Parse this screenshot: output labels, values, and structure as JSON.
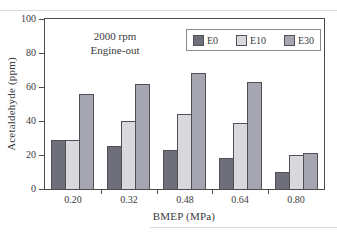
{
  "chart_data": {
    "type": "bar",
    "categories": [
      "0.20",
      "0.32",
      "0.48",
      "0.64",
      "0.80"
    ],
    "series": [
      {
        "name": "E0",
        "color": "#6f6f79",
        "values": [
          29,
          25,
          23,
          18,
          10
        ]
      },
      {
        "name": "E10",
        "color": "#d9d9dd",
        "values": [
          29,
          40,
          44,
          39,
          20
        ]
      },
      {
        "name": "E30",
        "color": "#a6a6b0",
        "values": [
          56,
          62,
          68,
          63,
          21
        ]
      }
    ],
    "xlabel": "BMEP (MPa)",
    "ylabel": "Acetaldehyde (ppm)",
    "ylim": [
      0,
      100
    ],
    "yticks": [
      0,
      20,
      40,
      60,
      80,
      100
    ],
    "annotation_lines": [
      "2000 rpm",
      "Engine-out"
    ],
    "legend_position": "top-right",
    "grid": false
  },
  "colors": {
    "axis": "#4b4a4e",
    "bar_border": "#514f57",
    "legend_border": "#8b8b8f",
    "text": "#3b3a3c"
  }
}
